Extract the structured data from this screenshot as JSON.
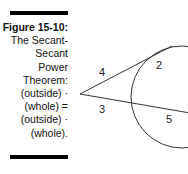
{
  "caption": {
    "title": "Figure 15-10:",
    "lines": [
      "The Secant-",
      "Secant",
      "Power",
      "Theorem:",
      "(outside) ·",
      "(whole) =",
      "(outside) ·",
      "(whole)."
    ]
  },
  "figure": {
    "segment_labels": {
      "upper_outside": "4",
      "upper_inside": "2",
      "lower_outside": "3",
      "lower_inside": "5"
    }
  }
}
